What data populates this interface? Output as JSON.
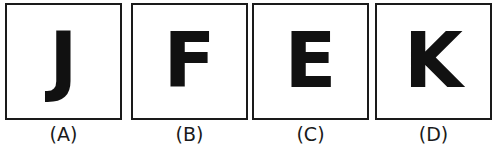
{
  "figure": {
    "background_color": "#ffffff",
    "border_color": "#1a1a1a",
    "letter_color": "#111111",
    "label_color": "#1a1a1a",
    "panels": [
      {
        "letter": "J",
        "label": "(A)"
      },
      {
        "letter": "F",
        "label": "(B)"
      },
      {
        "letter": "E",
        "label": "(C)"
      },
      {
        "letter": "K",
        "label": "(D)"
      }
    ]
  }
}
